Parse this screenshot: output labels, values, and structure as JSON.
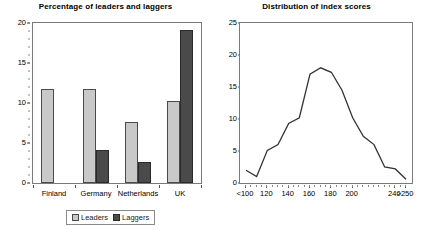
{
  "charts": [
    {
      "id": "leaders-laggers",
      "title": "Percentage of leaders and laggers",
      "legend": {
        "leaders": "Leaders",
        "laggers": "Laggers"
      },
      "colors": {
        "leaders": "#c9c9c9",
        "laggers": "#4a4a4a",
        "frame": "#7a7a7a"
      }
    },
    {
      "id": "index-distribution",
      "title": "Distribution of index scores",
      "legend": {
        "series": "UK Other Countries"
      },
      "colors": {
        "line": "#333333",
        "frame": "#7a7a7a"
      }
    }
  ],
  "chart_data": [
    {
      "type": "bar",
      "title": "Percentage of leaders and laggers",
      "xlabel": "",
      "ylabel": "",
      "ylim": [
        0,
        20
      ],
      "yticks": [
        0,
        5,
        10,
        15,
        20
      ],
      "grid": false,
      "legend_position": "bottom",
      "categories": [
        "Finland",
        "Germany",
        "Netherlands",
        "UK"
      ],
      "series": [
        {
          "name": "Leaders",
          "values": [
            11.8,
            11.8,
            7.6,
            10.2
          ]
        },
        {
          "name": "Laggers",
          "values": [
            0,
            4.1,
            2.6,
            19.1
          ]
        }
      ]
    },
    {
      "type": "line",
      "title": "Distribution of index scores",
      "xlabel": "",
      "ylabel": "",
      "ylim": [
        0,
        25
      ],
      "yticks": [
        0,
        5,
        10,
        15,
        20,
        25
      ],
      "grid": false,
      "legend_position": "bottom",
      "xticklabels": [
        "<100",
        "120",
        "140",
        "160",
        "180",
        "200",
        "240",
        ">250"
      ],
      "x": [
        "<100",
        "110",
        "120",
        "130",
        "140",
        "150",
        "160",
        "170",
        "180",
        "190",
        "200",
        "210",
        "220",
        "230",
        "240",
        ">250"
      ],
      "series": [
        {
          "name": "UK Other Countries",
          "values": [
            2.0,
            1.0,
            5.1,
            6.0,
            9.3,
            10.2,
            17.0,
            18.0,
            17.3,
            14.5,
            10.2,
            7.3,
            6.0,
            2.5,
            2.2,
            0.6
          ]
        }
      ]
    }
  ]
}
